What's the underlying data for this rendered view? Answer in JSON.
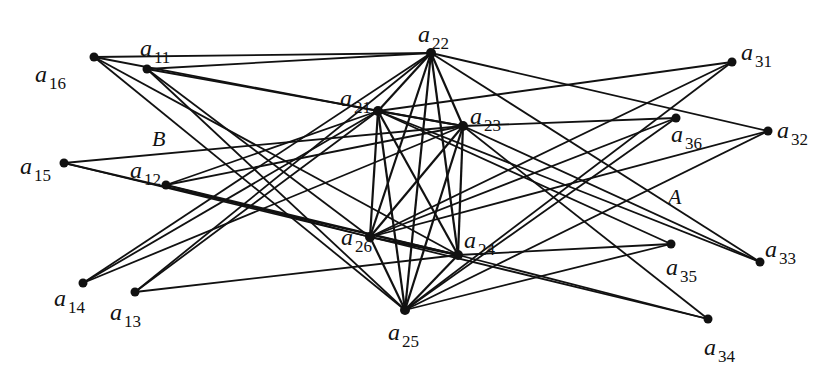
{
  "diagram": {
    "type": "graph",
    "region_labels": [
      {
        "id": "B",
        "text": "B"
      },
      {
        "id": "A",
        "text": "A"
      }
    ],
    "groups": [
      {
        "name": "left",
        "nodes": [
          "a16",
          "a11",
          "a15",
          "a12",
          "a14",
          "a13"
        ]
      },
      {
        "name": "center",
        "nodes": [
          "a21",
          "a22",
          "a23",
          "a24",
          "a25",
          "a26"
        ]
      },
      {
        "name": "right",
        "nodes": [
          "a31",
          "a32",
          "a33",
          "a34",
          "a35",
          "a36"
        ]
      }
    ],
    "nodes": [
      {
        "id": "a16",
        "base": "a",
        "sub": "16"
      },
      {
        "id": "a11",
        "base": "a",
        "sub": "11"
      },
      {
        "id": "a15",
        "base": "a",
        "sub": "15"
      },
      {
        "id": "a12",
        "base": "a",
        "sub": "12"
      },
      {
        "id": "a14",
        "base": "a",
        "sub": "14"
      },
      {
        "id": "a13",
        "base": "a",
        "sub": "13"
      },
      {
        "id": "a22",
        "base": "a",
        "sub": "22"
      },
      {
        "id": "a21",
        "base": "a",
        "sub": "21"
      },
      {
        "id": "a23",
        "base": "a",
        "sub": "23"
      },
      {
        "id": "a26",
        "base": "a",
        "sub": "26"
      },
      {
        "id": "a24",
        "base": "a",
        "sub": "24"
      },
      {
        "id": "a25",
        "base": "a",
        "sub": "25"
      },
      {
        "id": "a31",
        "base": "a",
        "sub": "31"
      },
      {
        "id": "a36",
        "base": "a",
        "sub": "36"
      },
      {
        "id": "a32",
        "base": "a",
        "sub": "32"
      },
      {
        "id": "a35",
        "base": "a",
        "sub": "35"
      },
      {
        "id": "a33",
        "base": "a",
        "sub": "33"
      },
      {
        "id": "a34",
        "base": "a",
        "sub": "34"
      }
    ],
    "edges": [
      [
        "a21",
        "a22"
      ],
      [
        "a21",
        "a23"
      ],
      [
        "a21",
        "a24"
      ],
      [
        "a21",
        "a25"
      ],
      [
        "a21",
        "a26"
      ],
      [
        "a22",
        "a23"
      ],
      [
        "a22",
        "a24"
      ],
      [
        "a22",
        "a25"
      ],
      [
        "a22",
        "a26"
      ],
      [
        "a23",
        "a24"
      ],
      [
        "a23",
        "a25"
      ],
      [
        "a23",
        "a26"
      ],
      [
        "a24",
        "a25"
      ],
      [
        "a24",
        "a26"
      ],
      [
        "a25",
        "a26"
      ],
      [
        "a16",
        "a22"
      ],
      [
        "a16",
        "a21"
      ],
      [
        "a16",
        "a24"
      ],
      [
        "a16",
        "a25"
      ],
      [
        "a11",
        "a22"
      ],
      [
        "a11",
        "a23"
      ],
      [
        "a11",
        "a26"
      ],
      [
        "a11",
        "a25"
      ],
      [
        "a15",
        "a23"
      ],
      [
        "a15",
        "a26"
      ],
      [
        "a15",
        "a24"
      ],
      [
        "a12",
        "a21"
      ],
      [
        "a12",
        "a23"
      ],
      [
        "a12",
        "a26"
      ],
      [
        "a12",
        "a24"
      ],
      [
        "a14",
        "a22"
      ],
      [
        "a14",
        "a21"
      ],
      [
        "a14",
        "a23"
      ],
      [
        "a13",
        "a22"
      ],
      [
        "a13",
        "a21"
      ],
      [
        "a13",
        "a24"
      ],
      [
        "a31",
        "a21"
      ],
      [
        "a31",
        "a26"
      ],
      [
        "a31",
        "a25"
      ],
      [
        "a36",
        "a23"
      ],
      [
        "a36",
        "a26"
      ],
      [
        "a36",
        "a25"
      ],
      [
        "a32",
        "a22"
      ],
      [
        "a32",
        "a26"
      ],
      [
        "a32",
        "a25"
      ],
      [
        "a35",
        "a24"
      ],
      [
        "a35",
        "a25"
      ],
      [
        "a35",
        "a21"
      ],
      [
        "a33",
        "a22"
      ],
      [
        "a33",
        "a23"
      ],
      [
        "a33",
        "a21"
      ],
      [
        "a34",
        "a23"
      ],
      [
        "a34",
        "a26"
      ],
      [
        "a34",
        "a24"
      ]
    ]
  }
}
